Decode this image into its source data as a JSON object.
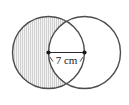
{
  "figure": {
    "kind": "two-overlapping-circles-venn",
    "background_color": "#ffffff",
    "stroke_color": "#4d4d4d",
    "stroke_width": 1.4,
    "shading": {
      "region": "left-circle-minus-overlap",
      "style": "vertical-line-hatch",
      "hatch_color": "#c8c8c8",
      "fill_color": "#f2f2f2",
      "hatch_spacing_px": 2
    },
    "left_circle": {
      "label": "left-circle",
      "center_x": 48.5,
      "center_y": 52.5,
      "radius": 36,
      "shaded": true
    },
    "right_circle": {
      "label": "right-circle",
      "center_x": 84.5,
      "center_y": 52.5,
      "radius": 36,
      "shaded": false
    },
    "dimension": {
      "label": "7 cm",
      "value": 7,
      "unit": "cm",
      "measures": "distance-between-centers",
      "line_color": "#2b2b2b",
      "from_x": 48.5,
      "to_x": 84.5,
      "y": 52.5,
      "endpoint_marker": "dot",
      "endpoint_dot_radius": 2.1,
      "tick_marks": 2,
      "label_color": "#1a1a1a",
      "label_x": 66.5,
      "label_y": 64
    }
  }
}
